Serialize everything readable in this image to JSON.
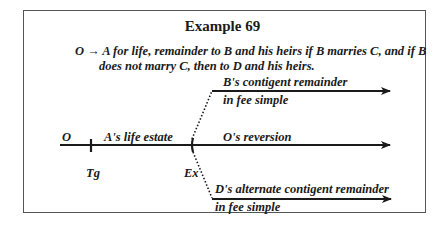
{
  "title": "Example 69",
  "conveyance": {
    "grantor": "O",
    "arrow": "→",
    "line1": "A for life, remainder to B and his heirs if B marries C, and if B",
    "line2": "does not marry C, then to D and his heirs."
  },
  "timeline": {
    "start_label": "O",
    "segment_label": "A's life estate",
    "tick1_label": "Tg",
    "tick2_label": "Ex",
    "main_branch_label": "O's reversion",
    "upper_branch": {
      "label_line1": "B's contigent remainder",
      "label_line2": "in fee simple"
    },
    "lower_branch": {
      "label_line1": "D's alternate contigent remainder",
      "label_line2": "in fee simple"
    }
  },
  "colors": {
    "line": "#1a1a1a",
    "border": "#555555",
    "background": "#ffffff"
  }
}
